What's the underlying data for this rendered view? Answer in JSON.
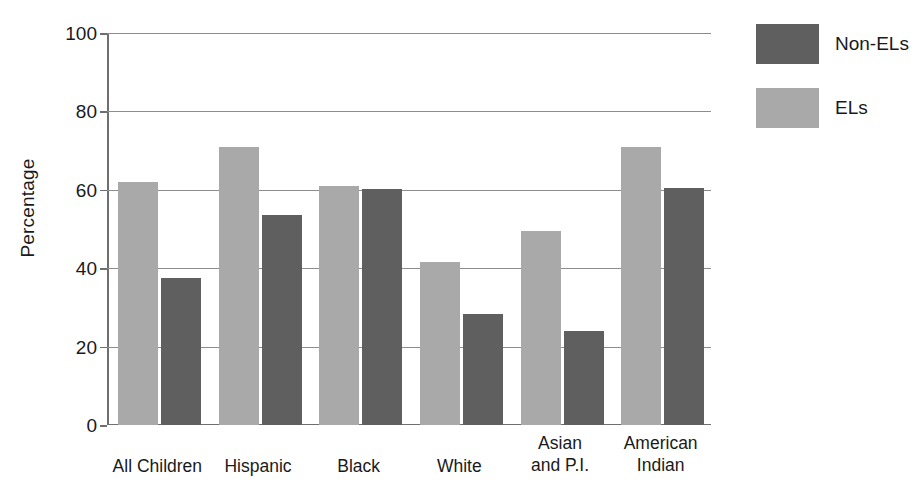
{
  "chart_data": {
    "type": "bar",
    "title": "",
    "subtitle": "",
    "xlabel": "",
    "ylabel": "Percentage",
    "ylim": [
      0,
      100
    ],
    "yticks": [
      0,
      20,
      40,
      60,
      80,
      100
    ],
    "ytick_labels": [
      "0",
      "20",
      "40",
      "60",
      "80",
      "100"
    ],
    "grid": "horizontal",
    "legend_position": "right-top",
    "categories": [
      "All Children",
      "Hispanic",
      "Black",
      "White",
      "Asian and P.I.",
      "American Indian"
    ],
    "category_label_lines": [
      [
        "All Children"
      ],
      [
        "Hispanic"
      ],
      [
        "Black"
      ],
      [
        "White"
      ],
      [
        "Asian",
        "and P.I."
      ],
      [
        "American",
        "Indian"
      ]
    ],
    "series": [
      {
        "name": "ELs",
        "color": "#a9a9a9",
        "values": [
          62,
          71,
          61,
          41.5,
          49.5,
          71
        ]
      },
      {
        "name": "Non-ELs",
        "color": "#5f5f5f",
        "values": [
          37.5,
          53.5,
          60.3,
          28.3,
          24,
          60.5
        ]
      }
    ]
  },
  "legend": {
    "entries": [
      {
        "label": "Non-ELs",
        "color": "#5f5f5f"
      },
      {
        "label": "ELs",
        "color": "#a9a9a9"
      }
    ]
  },
  "axes": {
    "y_title": "Percentage"
  },
  "colors": {
    "els": "#a9a9a9",
    "non_els": "#5f5f5f",
    "axis": "#6f6f6f",
    "gridline": "#8d8d8d",
    "text": "#1a1a1a",
    "background": "#ffffff"
  }
}
